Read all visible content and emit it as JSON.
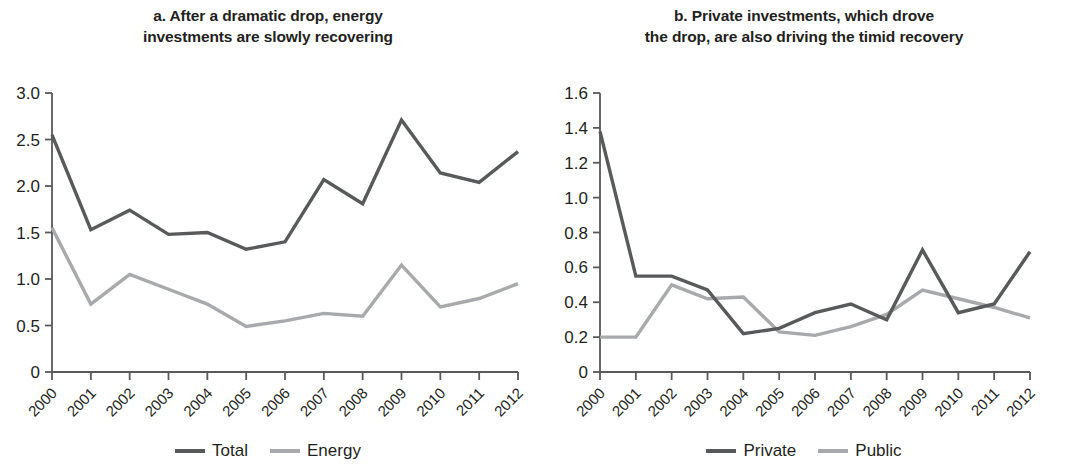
{
  "figure": {
    "width": 1072,
    "height": 465,
    "background": "#ffffff"
  },
  "colors": {
    "dark_series": "#58595b",
    "light_series": "#a7a9ac",
    "axis": "#58595b",
    "text": "#231f20"
  },
  "panels": [
    {
      "id": "panel-a",
      "title": "a. After a dramatic drop, energy investments are slowly recovering",
      "title_line1": "a. After a dramatic drop, energy",
      "title_line2": "investments are slowly recovering",
      "legend": [
        {
          "label": "Total",
          "color": "#58595b"
        },
        {
          "label": "Energy",
          "color": "#a7a9ac"
        }
      ]
    },
    {
      "id": "panel-b",
      "title": "b. Private investments, which drove the drop, are also driving the timid recovery",
      "title_line1": "b. Private investments, which drove",
      "title_line2": "the drop, are also driving the timid recovery",
      "legend": [
        {
          "label": "Private",
          "color": "#58595b"
        },
        {
          "label": "Public",
          "color": "#a7a9ac"
        }
      ]
    }
  ],
  "chart_data": [
    {
      "type": "line",
      "id": "panel-a",
      "title": "a. After a dramatic drop, energy investments are slowly recovering",
      "xlabel": "",
      "ylabel": "",
      "x": [
        2000,
        2001,
        2002,
        2003,
        2004,
        2005,
        2006,
        2007,
        2008,
        2009,
        2010,
        2011,
        2012
      ],
      "categories": [
        "2000",
        "2001",
        "2002",
        "2003",
        "2004",
        "2005",
        "2006",
        "2007",
        "2008",
        "2009",
        "2010",
        "2011",
        "2012"
      ],
      "ylim": [
        0,
        3.0
      ],
      "yticks": [
        0,
        0.5,
        1.0,
        1.5,
        2.0,
        2.5,
        3.0
      ],
      "ytick_labels": [
        "0",
        "0.5",
        "1.0",
        "1.5",
        "2.0",
        "2.5",
        "3.0"
      ],
      "grid": false,
      "legend_position": "bottom",
      "series": [
        {
          "name": "Total",
          "color": "#58595b",
          "values": [
            2.55,
            1.53,
            1.74,
            1.48,
            1.5,
            1.32,
            1.4,
            2.07,
            1.81,
            2.71,
            2.14,
            2.04,
            2.37
          ]
        },
        {
          "name": "Energy",
          "color": "#a7a9ac",
          "values": [
            1.55,
            0.73,
            1.05,
            0.89,
            0.73,
            0.49,
            0.55,
            0.63,
            0.6,
            1.15,
            0.7,
            0.79,
            0.95
          ]
        }
      ]
    },
    {
      "type": "line",
      "id": "panel-b",
      "title": "b. Private investments, which drove the drop, are also driving the timid recovery",
      "xlabel": "",
      "ylabel": "",
      "x": [
        2000,
        2001,
        2002,
        2003,
        2004,
        2005,
        2006,
        2007,
        2008,
        2009,
        2010,
        2011,
        2012
      ],
      "categories": [
        "2000",
        "2001",
        "2002",
        "2003",
        "2004",
        "2005",
        "2006",
        "2007",
        "2008",
        "2009",
        "2010",
        "2011",
        "2012"
      ],
      "ylim": [
        0,
        1.6
      ],
      "yticks": [
        0,
        0.2,
        0.4,
        0.6,
        0.8,
        1.0,
        1.2,
        1.4,
        1.6
      ],
      "ytick_labels": [
        "0",
        "0.2",
        "0.4",
        "0.6",
        "0.8",
        "1.0",
        "1.2",
        "1.4",
        "1.6"
      ],
      "grid": false,
      "legend_position": "bottom",
      "series": [
        {
          "name": "Private",
          "color": "#58595b",
          "values": [
            1.38,
            0.55,
            0.55,
            0.47,
            0.22,
            0.25,
            0.34,
            0.39,
            0.3,
            0.7,
            0.34,
            0.39,
            0.69
          ]
        },
        {
          "name": "Public",
          "color": "#a7a9ac",
          "values": [
            0.2,
            0.2,
            0.5,
            0.42,
            0.43,
            0.23,
            0.21,
            0.26,
            0.33,
            0.47,
            0.42,
            0.37,
            0.31
          ]
        }
      ]
    }
  ]
}
